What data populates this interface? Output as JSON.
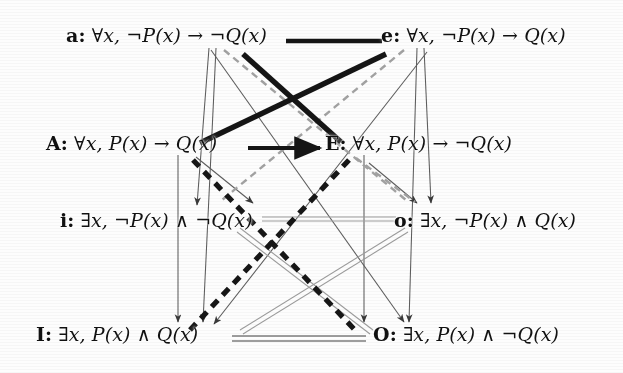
{
  "diagram": {
    "type": "logic-square-of-opposition",
    "canvas": {
      "width": 623,
      "height": 373
    },
    "nodes": [
      {
        "id": "a",
        "tag": "a",
        "separator": ":",
        "formula": "∀x, ¬P(x) → ¬Q(x)",
        "row": 0,
        "column": "left",
        "x": 66,
        "y": 26
      },
      {
        "id": "e",
        "tag": "e",
        "separator": ":",
        "formula": "∀x, ¬P(x) → Q(x)",
        "row": 0,
        "column": "right",
        "x": 381,
        "y": 26
      },
      {
        "id": "A",
        "tag": "A",
        "separator": ":",
        "formula": "∀x, P(x) → Q(x)",
        "row": 1,
        "column": "left",
        "x": 46,
        "y": 134
      },
      {
        "id": "E",
        "tag": "E",
        "separator": ":",
        "formula": "∀x, P(x) → ¬Q(x)",
        "row": 1,
        "column": "right",
        "x": 325,
        "y": 134
      },
      {
        "id": "i",
        "tag": "i",
        "separator": ":",
        "formula": "∃x, ¬P(x) ∧ ¬Q(x)",
        "row": 2,
        "column": "left",
        "x": 60,
        "y": 211
      },
      {
        "id": "o",
        "tag": "o",
        "separator": ":",
        "formula": "∃x, ¬P(x) ∧ Q(x)",
        "row": 2,
        "column": "right",
        "x": 394,
        "y": 211
      },
      {
        "id": "I",
        "tag": "I",
        "separator": ":",
        "formula": "∃x, P(x) ∧ Q(x)",
        "row": 3,
        "column": "left",
        "x": 36,
        "y": 325
      },
      {
        "id": "O",
        "tag": "O",
        "separator": ":",
        "formula": "∃x, P(x) ∧ ¬Q(x)",
        "row": 3,
        "column": "right",
        "x": 373,
        "y": 325
      }
    ],
    "edges": [
      {
        "id": "a-e",
        "from": "a",
        "to": "e",
        "style": "thick-solid-black",
        "relation": "contrariety"
      },
      {
        "id": "A-E",
        "from": "A",
        "to": "E",
        "style": "thick-solid-black",
        "relation": "contrariety"
      },
      {
        "id": "a-E",
        "from": "a",
        "to": "E",
        "style": "thick-solid-black",
        "relation": "contradiction"
      },
      {
        "id": "e-A",
        "from": "e",
        "to": "A",
        "style": "thick-solid-black",
        "relation": "contradiction"
      },
      {
        "id": "A-O",
        "from": "A",
        "to": "O",
        "style": "thick-dashed-black",
        "relation": "contradiction"
      },
      {
        "id": "E-I",
        "from": "E",
        "to": "I",
        "style": "thick-dashed-black",
        "relation": "contradiction"
      },
      {
        "id": "a-o",
        "from": "a",
        "to": "o",
        "style": "dashed-gray",
        "relation": "contradiction"
      },
      {
        "id": "e-i",
        "from": "e",
        "to": "i",
        "style": "dashed-gray",
        "relation": "contradiction"
      },
      {
        "id": "i-o",
        "from": "i",
        "to": "o",
        "style": "thin-gray-double",
        "relation": "subcontrariety"
      },
      {
        "id": "I-O",
        "from": "I",
        "to": "O",
        "style": "gray-double",
        "relation": "subcontrariety"
      },
      {
        "id": "i-O",
        "from": "i",
        "to": "O",
        "style": "thin-gray-double",
        "relation": "subcontrariety"
      },
      {
        "id": "o-I",
        "from": "o",
        "to": "I",
        "style": "thin-gray-double",
        "relation": "subcontrariety"
      },
      {
        "id": "a-i",
        "from": "a",
        "to": "i",
        "style": "thin-arrow",
        "relation": "subalternation"
      },
      {
        "id": "e-o",
        "from": "e",
        "to": "o",
        "style": "thin-arrow",
        "relation": "subalternation"
      },
      {
        "id": "A-I",
        "from": "A",
        "to": "I",
        "style": "thin-arrow",
        "relation": "subalternation"
      },
      {
        "id": "E-O",
        "from": "E",
        "to": "O",
        "style": "thin-arrow",
        "relation": "subalternation"
      },
      {
        "id": "a-I",
        "from": "a",
        "to": "I",
        "style": "thin-arrow",
        "relation": "subalternation"
      },
      {
        "id": "e-O",
        "from": "e",
        "to": "O",
        "style": "thin-arrow",
        "relation": "subalternation"
      }
    ],
    "colors": {
      "ink": "#111111",
      "thick_black": "#151515",
      "gray_dash": "#9a9a9a",
      "gray_thin": "#8e8e8e",
      "paper": "#fdfdfd"
    }
  }
}
